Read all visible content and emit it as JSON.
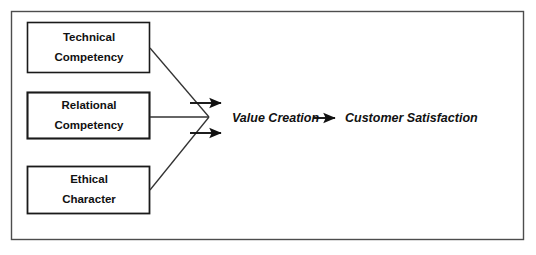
{
  "diagram": {
    "frame": {
      "name": "outer-frame",
      "stroke": "#4d4d4d",
      "fill": "#ffffff",
      "x": 11,
      "y": 11,
      "width": 513,
      "height": 229
    },
    "boxes": [
      {
        "id": "technical-competency",
        "line1": "Technical",
        "line2": "Competency",
        "x": 27,
        "y": 22,
        "width": 123,
        "height": 51,
        "stroke": "#1a1a1a",
        "stroke_width": 1.6
      },
      {
        "id": "relational-competency",
        "line1": "Relational",
        "line2": "Competency",
        "x": 27,
        "y": 92,
        "width": 123,
        "height": 47,
        "stroke": "#1a1a1a",
        "stroke_width": 2.1
      },
      {
        "id": "ethical-character",
        "line1": "Ethical",
        "line2": "Character",
        "x": 27,
        "y": 166,
        "width": 123,
        "height": 48,
        "stroke": "#1a1a1a",
        "stroke_width": 1.8
      }
    ],
    "converge_point": {
      "x": 209,
      "y": 117
    },
    "connectors": [
      {
        "id": "connector-technical-to-hub",
        "x1": 150,
        "y1": 48,
        "x2": 209,
        "y2": 117
      },
      {
        "id": "connector-relational-to-hub",
        "x1": 150,
        "y1": 117,
        "x2": 209,
        "y2": 117
      },
      {
        "id": "connector-ethical-to-hub",
        "x1": 150,
        "y1": 190,
        "x2": 209,
        "y2": 117
      }
    ],
    "output_arrows": [
      {
        "id": "hub-arrow-upper",
        "x1": 190,
        "y1": 103,
        "x2": 227,
        "y2": 103
      },
      {
        "id": "hub-arrow-lower",
        "x1": 190,
        "y1": 133,
        "x2": 227,
        "y2": 133
      }
    ],
    "flow": {
      "value_creation": "Value Creation",
      "customer_satisfaction": "Customer Satisfaction",
      "arrow_name": "value-to-satisfaction-arrow",
      "value_creation_x": 232,
      "satisfaction_x": 343,
      "baseline_y": 119,
      "arrow": {
        "x1": 312,
        "y1": 118,
        "x2": 340,
        "y2": 118
      }
    },
    "colors": {
      "stroke_dark": "#1a1a1a",
      "frame_gray": "#4d4d4d",
      "background": "#ffffff",
      "text": "#111111"
    }
  }
}
